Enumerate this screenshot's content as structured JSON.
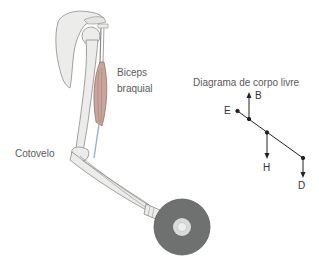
{
  "figure": {
    "labels": {
      "biceps_line1": "Biceps",
      "biceps_line2": "braquial",
      "elbow": "Cotovelo"
    },
    "free_body_diagram": {
      "title": "Diagrama de corpo livre",
      "forces": [
        {
          "label": "B",
          "direction": "up"
        },
        {
          "label": "H",
          "direction": "down"
        },
        {
          "label": "D",
          "direction": "down"
        }
      ],
      "points": [
        {
          "label": "E",
          "role": "pivot"
        }
      ]
    },
    "colors": {
      "bone": "#ececea",
      "bone_outline": "#8a8a88",
      "muscle": "#c9a49b",
      "weight": "#6f7170",
      "weight_hub": "#d9dbda",
      "text": "#5a5a5a",
      "diagram_line": "#222222"
    }
  }
}
